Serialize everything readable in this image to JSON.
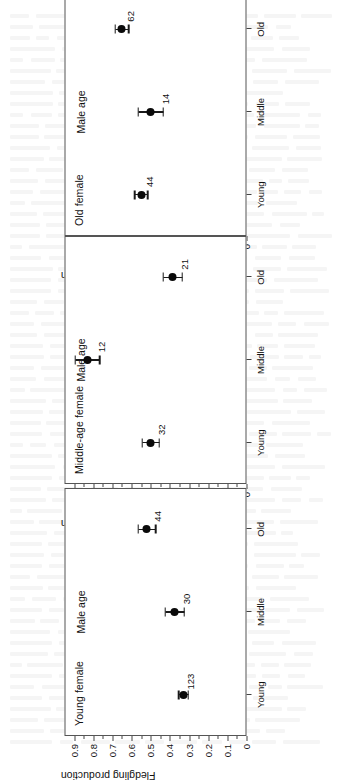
{
  "figure": {
    "axis_title_x": "Male age",
    "axis_title_y": "Fledgling production",
    "category_labels": [
      "Young",
      "Middle",
      "Old"
    ],
    "y_tick_labels": [
      "0.9",
      "0.8",
      "0.7",
      "0.6",
      "0.5",
      "0.4",
      "0.3",
      "0.2",
      "0.1",
      "0"
    ],
    "marker_color": "#0a0a0a",
    "axis_color": "#555555"
  },
  "chart_data": [
    {
      "type": "scatter",
      "title": "Old female",
      "xlabel": "Male age",
      "ylabel": "Fledgling production",
      "categories": [
        "Young",
        "Middle",
        "Old"
      ],
      "ylim": [
        0,
        0.95
      ],
      "yticks": [
        0,
        0.1,
        0.2,
        0.3,
        0.4,
        0.5,
        0.6,
        0.7,
        0.8,
        0.9
      ],
      "grid": false,
      "legend": "none",
      "values": [
        0.55,
        0.5,
        0.65
      ],
      "err_low": [
        0.515,
        0.435,
        0.615
      ],
      "err_high": [
        0.585,
        0.565,
        0.685
      ],
      "point_labels": [
        "44",
        "14",
        "62"
      ]
    },
    {
      "type": "scatter",
      "title": "Middle-age female",
      "xlabel": "Male age",
      "ylabel": "Fledgling production",
      "categories": [
        "Young",
        "Middle",
        "Old"
      ],
      "ylim": [
        0,
        0.95
      ],
      "yticks": [
        0,
        0.1,
        0.2,
        0.3,
        0.4,
        0.5,
        0.6,
        0.7,
        0.8,
        0.9
      ],
      "grid": false,
      "legend": "none",
      "values": [
        0.5,
        0.83,
        0.385
      ],
      "err_low": [
        0.455,
        0.765,
        0.335
      ],
      "err_high": [
        0.545,
        0.895,
        0.435
      ],
      "point_labels": [
        "32",
        "12",
        "21"
      ]
    },
    {
      "type": "scatter",
      "title": "Young female",
      "xlabel": "Male age",
      "ylabel": "Fledgling production",
      "categories": [
        "Young",
        "Middle",
        "Old"
      ],
      "ylim": [
        0,
        0.95
      ],
      "yticks": [
        0,
        0.1,
        0.2,
        0.3,
        0.4,
        0.5,
        0.6,
        0.7,
        0.8,
        0.9
      ],
      "grid": false,
      "legend": "none",
      "values": [
        0.33,
        0.375,
        0.52
      ],
      "err_low": [
        0.305,
        0.325,
        0.475
      ],
      "err_high": [
        0.355,
        0.425,
        0.565
      ],
      "point_labels": [
        "123",
        "30",
        "44"
      ]
    }
  ]
}
